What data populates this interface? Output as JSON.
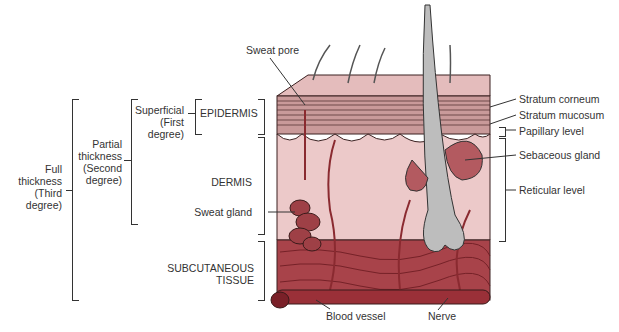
{
  "diagram": {
    "layers": {
      "epidermis": "EPIDERMIS",
      "dermis": "DERMIS",
      "subcutaneous_line1": "SUBCUTANEOUS",
      "subcutaneous_line2": "TISSUE"
    },
    "burn_depths": {
      "superficial": [
        "Superficial",
        "(First",
        "degree)"
      ],
      "partial": [
        "Partial",
        "thickness",
        "(Second",
        "degree)"
      ],
      "full": [
        "Full",
        "thickness",
        "(Third",
        "degree)"
      ]
    },
    "structures": {
      "sweat_pore": "Sweat pore",
      "sweat_gland": "Sweat gland",
      "blood_vessel": "Blood vessel",
      "nerve": "Nerve",
      "stratum_corneum": "Stratum corneum",
      "stratum_mucosum": "Stratum mucosum",
      "papillary_level": "Papillary level",
      "sebaceous_gland": "Sebaceous gland",
      "reticular_level": "Reticular level"
    },
    "colors": {
      "epidermis_top": "#e2b8b8",
      "dermis": "#ecc9c9",
      "subcutaneous": "#a8434a",
      "vessel": "#8a2a30",
      "hair": "#b9b9b9",
      "line": "#333333"
    }
  }
}
